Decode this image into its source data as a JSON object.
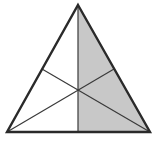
{
  "diagram": {
    "type": "equilateral-triangle-medians",
    "vertices": {
      "apex": [
        78,
        5
      ],
      "bottom_left": [
        7,
        132
      ],
      "bottom_right": [
        150,
        132
      ]
    },
    "midpoints": {
      "bottom": [
        78,
        132
      ],
      "left_side": [
        42,
        69
      ],
      "right_side": [
        114,
        69
      ]
    },
    "centroid": [
      78,
      90
    ],
    "shaded_region": "right-half",
    "colors": {
      "outline": "#2a2a2a",
      "median": "#3a3a3a",
      "shade": "#c8c8c8",
      "background": "#ffffff"
    }
  }
}
